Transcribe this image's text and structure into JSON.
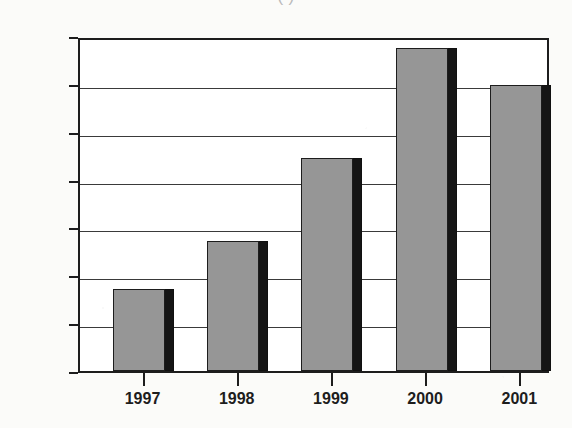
{
  "title": {
    "visible_fragment": "(                              )",
    "note_clipped": "top title cropped at image edge"
  },
  "colors": {
    "bar_face": "#969696",
    "bar_side": "#151515",
    "axis": "#1d1d1d",
    "plot_background": "#ffffff",
    "page_background": "#fbfbf9"
  },
  "chart_data": {
    "type": "bar",
    "title": "",
    "xlabel": "",
    "ylabel": "",
    "categories": [
      "1997",
      "1998",
      "1999",
      "2000",
      "2001"
    ],
    "values": [
      1672,
      1772,
      1945,
      2175,
      2097
    ],
    "ylim": [
      1500,
      2200
    ],
    "ytick_step": 100,
    "yticks": [
      "2,200",
      "2,100",
      "2,000",
      "1,900",
      "1,800",
      "1,700",
      "1,600",
      "1,500"
    ],
    "ytick_values": [
      2200,
      2100,
      2000,
      1900,
      1800,
      1700,
      1600,
      1500
    ],
    "grid": "horizontal",
    "legend": "none",
    "style": "3d-shadowed-bars"
  }
}
